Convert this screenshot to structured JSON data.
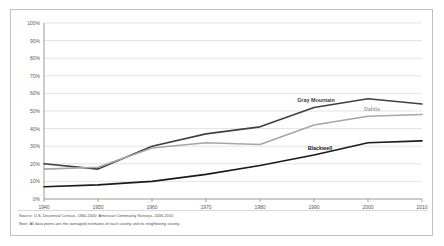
{
  "chart_data": {
    "type": "line",
    "title": "",
    "xlabel": "",
    "ylabel": "",
    "x": [
      1940,
      1950,
      1960,
      1970,
      1980,
      1990,
      2000,
      2010
    ],
    "xticklabels": [
      "1940",
      "1950",
      "1960",
      "1970",
      "1980",
      "1990",
      "2000",
      "2010"
    ],
    "yticklabels": [
      "0%",
      "10%",
      "20%",
      "30%",
      "40%",
      "50%",
      "60%",
      "70%",
      "80%",
      "90%",
      "100%"
    ],
    "yticks": [
      0,
      10,
      20,
      30,
      40,
      50,
      60,
      70,
      80,
      90,
      100
    ],
    "ylim": [
      0,
      100
    ],
    "xlim": [
      1940,
      2010
    ],
    "grid": "horizontal",
    "legend_position": "inline-labels",
    "series": [
      {
        "name": "Gray Mountain",
        "color": "#404040",
        "values": [
          20,
          17,
          30,
          37,
          41,
          52,
          57,
          54
        ]
      },
      {
        "name": "Dahlia",
        "color": "#a6a6a6",
        "values": [
          17,
          18,
          29,
          32,
          31,
          42,
          47,
          48
        ]
      },
      {
        "name": "Blackwell",
        "color": "#1a1a1a",
        "values": [
          7,
          8,
          10,
          14,
          19,
          25,
          32,
          33
        ]
      }
    ]
  },
  "labels": {
    "gray_mountain": "Gray Mountain",
    "dahlia": "Dahlia",
    "blackwell": "Blackwell"
  },
  "footnotes": {
    "source": "Source: U.S. Decennial Census, 1940-2000; American Community Surveys, 2006-2010",
    "note": "Note: All data points are the averaged estimates of each county and its neighboring county."
  },
  "colors": {
    "gray_mountain": "#404040",
    "dahlia": "#a6a6a6",
    "blackwell": "#1a1a1a",
    "gridline": "#d9d9d9",
    "axis": "#808080",
    "tick_text": "#595959",
    "card_border": "#bfbfbf",
    "background": "#ffffff"
  }
}
